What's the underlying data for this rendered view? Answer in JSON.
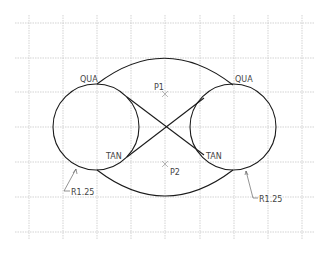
{
  "drawing": {
    "grid": {
      "color": "#c8c8c8",
      "x_lines": [
        29,
        63,
        97,
        131,
        165,
        200,
        234,
        268,
        302
      ],
      "y_lines": [
        23,
        58,
        92,
        127,
        162,
        197,
        232
      ],
      "x_extent": [
        15,
        315
      ],
      "y_extent": [
        15,
        240
      ]
    },
    "stroke_color": "#1a1a1a",
    "left_circle": {
      "cx": 96,
      "cy": 127,
      "r": 43
    },
    "right_circle": {
      "cx": 233,
      "cy": 127,
      "r": 43
    },
    "crossing_point": {
      "x": 165,
      "y": 127
    },
    "labels": {
      "qua_left": "QUA",
      "qua_right": "QUA",
      "tan_left": "TAN",
      "tan_right": "TAN",
      "p1": "P1",
      "p2": "P2",
      "radius_left": "R1.25",
      "radius_right": "R1.25"
    }
  }
}
